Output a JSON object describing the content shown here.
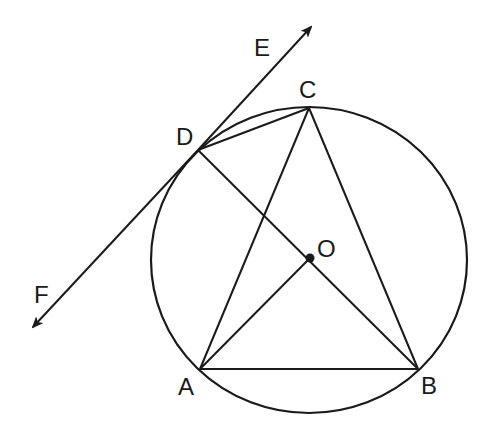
{
  "diagram": {
    "type": "geometry",
    "colors": {
      "stroke": "#1a1a1a",
      "background": "#ffffff"
    },
    "circle": {
      "center": "O",
      "cx": 309,
      "cy": 260,
      "rx": 158,
      "ry": 153
    },
    "points": {
      "A": {
        "label": "A",
        "x": 200,
        "y": 369,
        "label_x": 178,
        "label_y": 395
      },
      "B": {
        "label": "B",
        "x": 418,
        "y": 369,
        "label_x": 421,
        "label_y": 394
      },
      "C": {
        "label": "C",
        "x": 309,
        "y": 108,
        "label_x": 299,
        "label_y": 98
      },
      "D": {
        "label": "D",
        "x": 198,
        "y": 150,
        "label_x": 176,
        "label_y": 145
      },
      "O": {
        "label": "O",
        "x": 310,
        "y": 258,
        "label_x": 317,
        "label_y": 257
      },
      "E": {
        "label": "E",
        "x": 311,
        "y": 27,
        "label_x": 254,
        "label_y": 56
      },
      "F": {
        "label": "F",
        "x": 33,
        "y": 327,
        "label_x": 34,
        "label_y": 303
      }
    },
    "segments": [
      {
        "from": "A",
        "to": "B"
      },
      {
        "from": "A",
        "to": "C"
      },
      {
        "from": "B",
        "to": "C"
      },
      {
        "from": "D",
        "to": "C"
      },
      {
        "from": "D",
        "to": "B"
      },
      {
        "from": "A",
        "to": "O"
      }
    ],
    "tangent_line": {
      "through": "D",
      "ends": [
        "E",
        "F"
      ],
      "arrows": "both"
    }
  }
}
